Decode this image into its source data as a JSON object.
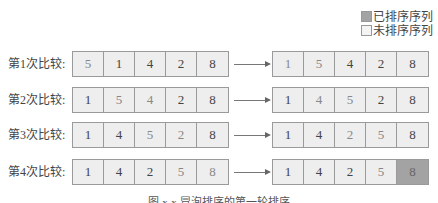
{
  "legend": {
    "sorted": {
      "label": "已排序序列",
      "color": "#a3a3a3"
    },
    "unsorted": {
      "label": "未排序序列",
      "color": "#eeeeee"
    }
  },
  "rows": [
    {
      "label": "第1次比较:",
      "before": [
        "5",
        "1",
        "4",
        "2",
        "8"
      ],
      "after": [
        "1",
        "5",
        "4",
        "2",
        "8"
      ]
    },
    {
      "label": "第2次比较:",
      "before": [
        "1",
        "5",
        "4",
        "2",
        "8"
      ],
      "after": [
        "1",
        "4",
        "5",
        "2",
        "8"
      ]
    },
    {
      "label": "第3次比较:",
      "before": [
        "1",
        "4",
        "5",
        "2",
        "8"
      ],
      "after": [
        "1",
        "4",
        "2",
        "5",
        "8"
      ]
    },
    {
      "label": "第4次比较:",
      "before": [
        "1",
        "4",
        "2",
        "5",
        "8"
      ],
      "after": [
        "1",
        "4",
        "2",
        "5",
        "8"
      ]
    }
  ],
  "caption": "图 x-x  冒泡排序的第一轮排序"
}
